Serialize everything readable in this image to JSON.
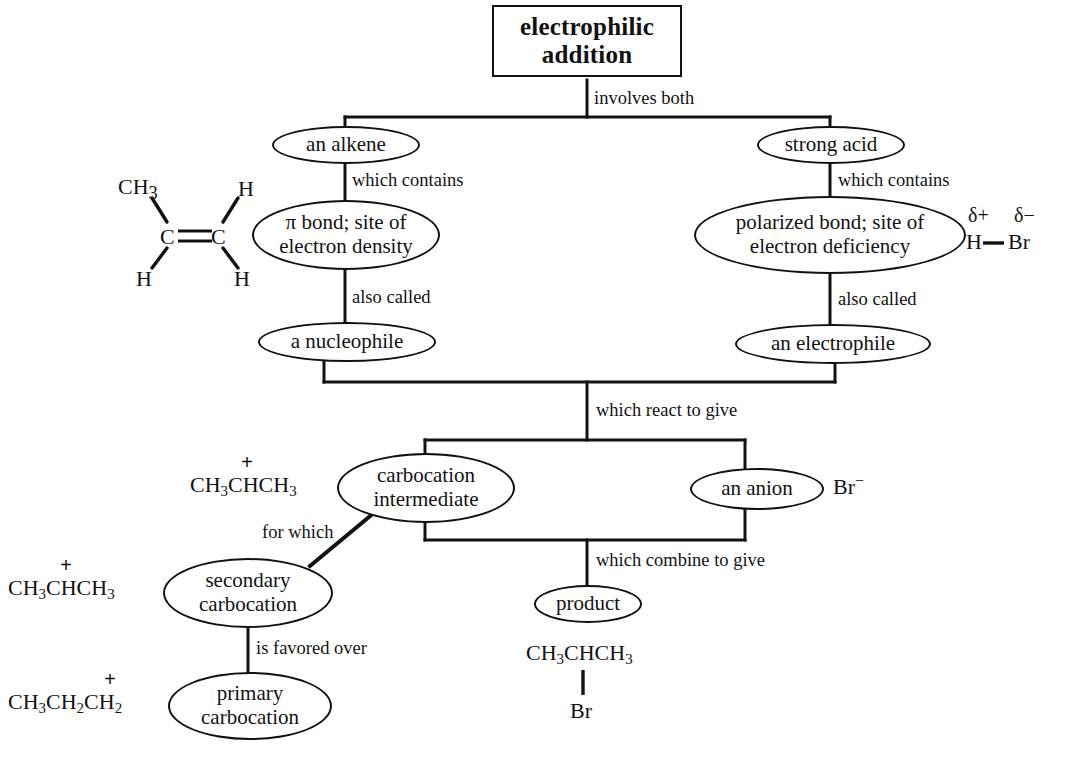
{
  "diagram": {
    "title": "electrophilic addition",
    "type": "concept-map",
    "nodes": {
      "root": "electrophilic addition",
      "alkene": "an alkene",
      "strong_acid": "strong acid",
      "pi_bond": {
        "line1": "π bond; site of",
        "line2": "electron density"
      },
      "polarized_bond": {
        "line1": "polarized bond; site of",
        "line2": "electron deficiency"
      },
      "nucleophile": "a nucleophile",
      "electrophile": "an electrophile",
      "carbocation_intermediate": {
        "line1": "carbocation",
        "line2": "intermediate"
      },
      "anion": "an anion",
      "secondary_carbocation": {
        "line1": "secondary",
        "line2": "carbocation"
      },
      "primary_carbocation": {
        "line1": "primary",
        "line2": "carbocation"
      },
      "product": "product"
    },
    "link_labels": {
      "involves_both": "involves both",
      "which_contains_left": "which contains",
      "which_contains_right": "which contains",
      "also_called_left": "also called",
      "also_called_right": "also called",
      "which_react_to_give": "which react to give",
      "for_which": "for which",
      "is_favored_over": "is favored over",
      "which_combine_to_give": "which combine to give"
    },
    "structures": {
      "alkene_structure": {
        "top_left": "CH",
        "top_left_sub": "3",
        "top_right": "H",
        "carbon_left": "C",
        "carbon_right": "C",
        "bottom_left": "H",
        "bottom_right": "H",
        "bond": "double"
      },
      "hbr_structure": {
        "delta_plus": "δ+",
        "delta_minus": "δ−",
        "atom_left": "H",
        "atom_right": "Br",
        "bond": "single"
      },
      "bromide_anion": {
        "formula": "Br",
        "charge": "−"
      },
      "isopropyl_cation_top": {
        "formula_parts": [
          "CH",
          "3",
          "CHCH",
          "3"
        ],
        "charge": "+"
      },
      "isopropyl_cation_secondary": {
        "formula_parts": [
          "CH",
          "3",
          "CHCH",
          "3"
        ],
        "charge": "+"
      },
      "propyl_cation_primary": {
        "formula_parts": [
          "CH",
          "3",
          "CH",
          "2",
          "CH",
          "2"
        ],
        "charge": "+"
      },
      "product_structure": {
        "main_parts": [
          "CH",
          "3",
          "CHCH",
          "3"
        ],
        "substituent": "Br",
        "bond": "vertical-single"
      }
    },
    "colors": {
      "ink": "#121212",
      "background": "#ffffff"
    }
  }
}
